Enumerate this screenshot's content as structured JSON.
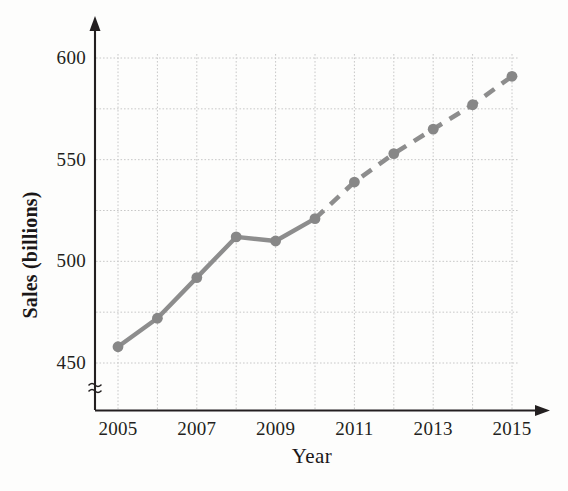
{
  "chart_data": {
    "type": "line",
    "title": "",
    "xlabel": "Year",
    "ylabel": "Sales (billions)",
    "x": [
      2005,
      2006,
      2007,
      2008,
      2009,
      2010,
      2011,
      2012,
      2013,
      2014,
      2015
    ],
    "values": [
      458,
      472,
      492,
      512,
      510,
      521,
      539,
      553,
      565,
      577,
      591
    ],
    "series": [
      {
        "name": "Actual sales",
        "style": "solid",
        "x": [
          2005,
          2006,
          2007,
          2008,
          2009,
          2010
        ],
        "values": [
          458,
          472,
          492,
          512,
          510,
          521
        ]
      },
      {
        "name": "Projected sales",
        "style": "dashed",
        "x": [
          2010,
          2011,
          2012,
          2013,
          2014,
          2015
        ],
        "values": [
          521,
          539,
          553,
          565,
          577,
          591
        ]
      }
    ],
    "xlim": [
      2005,
      2015
    ],
    "ylim": [
      450,
      600
    ],
    "y_gridline_values": [
      450,
      475,
      500,
      525,
      550,
      575,
      600
    ],
    "y_tick_labels": [
      "600",
      "550",
      "500",
      "450"
    ],
    "y_tick_values": [
      600,
      550,
      500,
      450
    ],
    "x_tick_labels": [
      "2005",
      "2007",
      "2009",
      "2011",
      "2013",
      "2015"
    ],
    "x_tick_values": [
      2005,
      2007,
      2009,
      2011,
      2013,
      2015
    ],
    "x_gridline_values": [
      2005,
      2006,
      2007,
      2008,
      2009,
      2010,
      2011,
      2012,
      2013,
      2014,
      2015
    ],
    "grid": true,
    "legend": "none",
    "y_axis_break": true,
    "colors": {
      "series_line": "#8d8d8d",
      "marker": "#878787",
      "grid": "#c8c8c8",
      "axis": "#231f20",
      "text": "#231f20",
      "background": "#fdfdfc"
    }
  },
  "axis_break_symbol": "≈"
}
